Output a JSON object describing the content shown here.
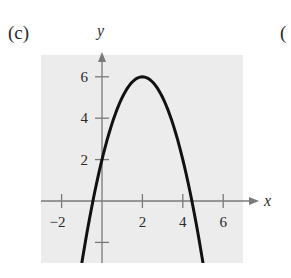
{
  "panel": {
    "label": "(c)",
    "next_panel_label_partial": "("
  },
  "colors": {
    "plot_background": "#ececec",
    "axis": "#7a7a7a",
    "curve": "#111111",
    "text": "#2a2a2a"
  },
  "chart_data": {
    "type": "line",
    "title": "",
    "xlabel": "x",
    "ylabel": "y",
    "xlim": [
      -3,
      7
    ],
    "ylim": [
      -3,
      7
    ],
    "grid": false,
    "legend": null,
    "x_ticks": [
      -2,
      2,
      4,
      6
    ],
    "x_tick_labels": [
      "−2",
      "2",
      "4",
      "6"
    ],
    "y_ticks": [
      -2,
      2,
      4,
      6
    ],
    "y_tick_labels": [
      "",
      "2",
      "4",
      "6"
    ],
    "series": [
      {
        "name": "parabola",
        "description": "downward-opening parabola, vertex (2, 6), y-intercept 2, x-intercepts ≈ -0.45 and 4.45",
        "x": [
          -1,
          -0.5,
          0,
          0.5,
          1,
          1.5,
          2,
          2.5,
          3,
          3.5,
          4,
          4.5,
          5
        ],
        "y": [
          -3,
          -0.25,
          2,
          3.75,
          5,
          5.75,
          6,
          5.75,
          5,
          3.75,
          2,
          -0.25,
          -3
        ]
      }
    ],
    "annotations": []
  }
}
